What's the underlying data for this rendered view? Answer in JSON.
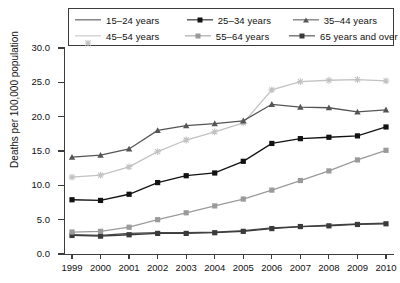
{
  "chart_data": {
    "type": "line",
    "title": "",
    "xlabel": "",
    "ylabel": "Deaths per 100,000 population",
    "x": [
      1999,
      2000,
      2001,
      2002,
      2003,
      2004,
      2005,
      2006,
      2007,
      2008,
      2009,
      2010
    ],
    "categories": [
      "1999",
      "2000",
      "2001",
      "2002",
      "2003",
      "2004",
      "2005",
      "2006",
      "2007",
      "2008",
      "2009",
      "2010"
    ],
    "xlim": [
      1999,
      2010
    ],
    "ylim": [
      0.0,
      30.0
    ],
    "yticks": [
      "0.0",
      "5.0",
      "10.0",
      "15.0",
      "20.0",
      "25.0",
      "30.0"
    ],
    "ytick_values": [
      0.0,
      5.0,
      10.0,
      15.0,
      20.0,
      25.0,
      30.0
    ],
    "grid": false,
    "legend_position": "top",
    "series": [
      {
        "name": "15–24 years",
        "marker": "none",
        "color": "#4a4a4a",
        "values": [
          2.8,
          2.7,
          3.0,
          3.1,
          3.1,
          3.2,
          3.4,
          3.8,
          4.0,
          4.2,
          4.4,
          4.5
        ]
      },
      {
        "name": "25–34 years",
        "marker": "square",
        "color": "#121212",
        "values": [
          7.9,
          7.8,
          8.7,
          10.4,
          11.4,
          11.8,
          13.5,
          16.1,
          16.8,
          17.0,
          17.2,
          18.5
        ]
      },
      {
        "name": "35–44 years",
        "marker": "triangle",
        "color": "#555555",
        "values": [
          14.1,
          14.4,
          15.3,
          18.0,
          18.7,
          19.0,
          19.4,
          21.8,
          21.4,
          21.3,
          20.7,
          21.0
        ]
      },
      {
        "name": "45–54 years",
        "marker": "star",
        "color": "#c2c2c2",
        "values": [
          11.2,
          11.5,
          12.7,
          14.9,
          16.6,
          17.8,
          19.1,
          23.9,
          25.1,
          25.3,
          25.4,
          25.2
        ]
      },
      {
        "name": "55–64 years",
        "marker": "square",
        "color": "#9a9a9a",
        "values": [
          3.2,
          3.3,
          3.9,
          5.0,
          6.0,
          7.0,
          8.0,
          9.3,
          10.7,
          12.1,
          13.7,
          15.1
        ]
      },
      {
        "name": "65 years and over",
        "marker": "square",
        "color": "#3a3a3a",
        "values": [
          2.7,
          2.6,
          2.8,
          3.0,
          3.0,
          3.1,
          3.3,
          3.7,
          4.0,
          4.1,
          4.3,
          4.4
        ]
      }
    ]
  },
  "legend": {
    "items": [
      {
        "label": "15–24 years",
        "marker": "none",
        "color": "#4a4a4a"
      },
      {
        "label": "25–34 years",
        "marker": "square",
        "color": "#121212"
      },
      {
        "label": "35–44 years",
        "marker": "triangle",
        "color": "#555555"
      },
      {
        "label": "45–54 years",
        "marker": "star",
        "color": "#c2c2c2"
      },
      {
        "label": "55–64 years",
        "marker": "square",
        "color": "#9a9a9a"
      },
      {
        "label": "65 years and over",
        "marker": "square",
        "color": "#3a3a3a"
      }
    ]
  }
}
